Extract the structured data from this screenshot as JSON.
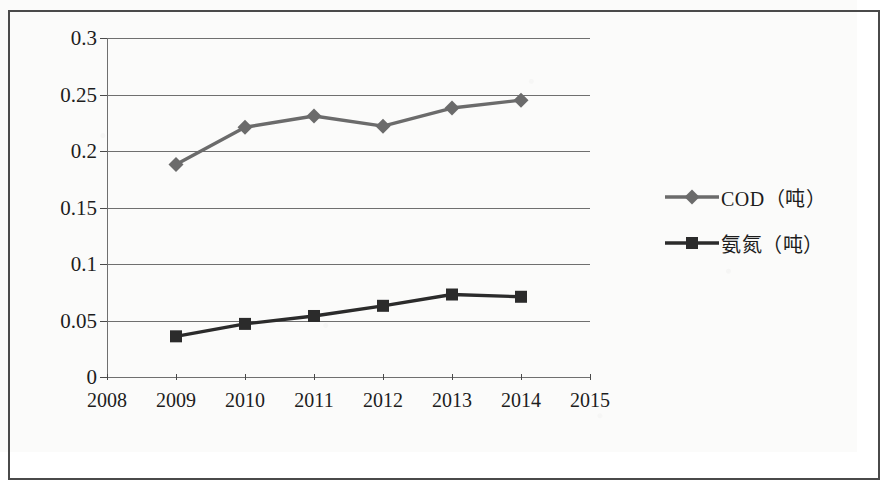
{
  "chart_data": {
    "type": "line",
    "title": "",
    "xlabel": "",
    "ylabel": "",
    "x": [
      2008,
      2009,
      2010,
      2011,
      2012,
      2013,
      2014,
      2015
    ],
    "xtick_labels": [
      "2008",
      "2009",
      "2010",
      "2011",
      "2012",
      "2013",
      "2014",
      "2015"
    ],
    "ytick_labels": [
      "0",
      "0.05",
      "0.1",
      "0.15",
      "0.2",
      "0.25",
      "0.3"
    ],
    "ytick_values": [
      0,
      0.05,
      0.1,
      0.15,
      0.2,
      0.25,
      0.3
    ],
    "ylim": [
      0,
      0.3
    ],
    "xlim": [
      2008,
      2015
    ],
    "grid": "horizontal",
    "legend_position": "right",
    "series": [
      {
        "name": "COD（吨）",
        "marker": "diamond",
        "color": "#6b6b6b",
        "x": [
          2009,
          2010,
          2011,
          2012,
          2013,
          2014
        ],
        "values": [
          0.188,
          0.221,
          0.231,
          0.222,
          0.238,
          0.245
        ]
      },
      {
        "name": "氨氮（吨）",
        "marker": "square",
        "color": "#2b2b2b",
        "x": [
          2009,
          2010,
          2011,
          2012,
          2013,
          2014
        ],
        "values": [
          0.036,
          0.047,
          0.054,
          0.063,
          0.073,
          0.071
        ]
      }
    ]
  },
  "legend": {
    "items": [
      {
        "label": "COD（吨）",
        "marker": "diamond-marker-icon",
        "color": "#6b6b6b"
      },
      {
        "label": "氨氮（吨）",
        "marker": "square-marker-icon",
        "color": "#2b2b2b"
      }
    ]
  }
}
